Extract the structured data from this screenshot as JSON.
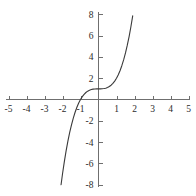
{
  "chart_data": {
    "type": "line",
    "title": "",
    "subtitle": "",
    "xlabel": "",
    "ylabel": "",
    "expression": "y = x^3 + 1",
    "xlim": [
      -5,
      5
    ],
    "ylim": [
      -8,
      8
    ],
    "grid": false,
    "legend": null,
    "x_ticks": [
      -5,
      -4,
      -3,
      -2,
      -1,
      1,
      2,
      3,
      4,
      5
    ],
    "x_tick_labels": [
      "-5",
      "-4",
      "-3",
      "-2",
      "-1",
      "1",
      "2",
      "3",
      "4",
      "5"
    ],
    "y_ticks": [
      -8,
      -6,
      -4,
      -2,
      2,
      4,
      6,
      8
    ],
    "y_tick_labels": [
      "-8",
      "-6",
      "-4",
      "-2",
      "2",
      "4",
      "6",
      "8"
    ],
    "origin_label": "",
    "series": [
      {
        "name": "y = x^3 + 1",
        "color": "#3a3a3a",
        "x": [
          -2.08,
          -2.0,
          -1.9,
          -1.8,
          -1.7,
          -1.6,
          -1.5,
          -1.4,
          -1.3,
          -1.2,
          -1.1,
          -1.0,
          -0.9,
          -0.8,
          -0.7,
          -0.6,
          -0.5,
          -0.4,
          -0.3,
          -0.2,
          -0.1,
          0.0,
          0.1,
          0.2,
          0.3,
          0.4,
          0.5,
          0.6,
          0.7,
          0.8,
          0.9,
          1.0,
          1.1,
          1.2,
          1.3,
          1.4,
          1.5,
          1.6,
          1.7,
          1.8,
          1.9,
          2.0,
          2.08
        ],
        "y": [
          -8.0,
          -7.0,
          -5.859,
          -4.832,
          -3.913,
          -3.096,
          -2.375,
          -1.744,
          -1.197,
          -0.728,
          -0.331,
          0.0,
          0.271,
          0.488,
          0.657,
          0.784,
          0.875,
          0.936,
          0.973,
          0.992,
          0.999,
          1.0,
          1.001,
          1.008,
          1.027,
          1.064,
          1.125,
          1.216,
          1.343,
          1.512,
          1.729,
          2.0,
          2.331,
          2.728,
          3.197,
          3.744,
          4.375,
          5.096,
          5.913,
          6.832,
          7.859,
          9.0,
          10.0
        ]
      }
    ],
    "key_points": {
      "y_intercept": 1,
      "x_intercept": -1,
      "inflection": [
        0,
        1
      ]
    },
    "colors": {
      "axis": "#6f6f6f",
      "curve": "#3a3a3a",
      "label": "#2b2b2b",
      "background": "#ffffff"
    }
  }
}
